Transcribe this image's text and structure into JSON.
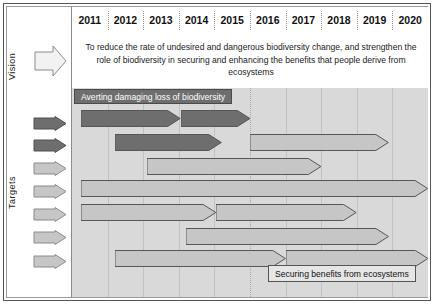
{
  "figure": {
    "sidebar": {
      "vision_label": "Vision",
      "targets_label": "Targets",
      "vision_arrow_icon": "right-arrow-outline-icon",
      "target_arrow_icons": [
        "right-arrow-dark-icon",
        "right-arrow-dark-icon",
        "right-arrow-light-icon",
        "right-arrow-light-icon",
        "right-arrow-light-icon",
        "right-arrow-light-icon",
        "right-arrow-light-icon"
      ]
    },
    "vision_statement": "To reduce the rate of undesired and dangerous biodiversity change,  and strengthen the role of biodiversity in securing and enhancing the benefits that people derive from ecosystems",
    "banners": {
      "top_left": "Averting damaging loss of biodiversity",
      "bottom_right": "Securing benefits from ecosystems"
    },
    "colors": {
      "plot_background": "#d9d9d9",
      "dark_bar": "#6e6e6e",
      "light_bar": "#c6c6c6",
      "bar_outline": "#555555",
      "grid": "#c2c2c2",
      "banner_dark_bg": "#6e6e6e",
      "banner_light_bg": "#e6e6e6"
    }
  },
  "chart_data": {
    "type": "bar",
    "xlabel": "",
    "ylabel": "Targets",
    "grid": true,
    "legend": "none",
    "x": [
      "2011",
      "2012",
      "2013",
      "2014",
      "2015",
      "2016",
      "2017",
      "2018",
      "2019",
      "2020"
    ],
    "xlim": [
      2011,
      2021
    ],
    "categories": [
      "Target row 1",
      "Target row 2",
      "Target row 3",
      "Target row 4",
      "Target row 5",
      "Target row 6",
      "Target row 7"
    ],
    "series": [
      {
        "name": "Target row 1",
        "row": 1,
        "bars": [
          {
            "start_year": 2011.25,
            "end_year": 2014.05,
            "shade": "dark"
          },
          {
            "start_year": 2014.05,
            "end_year": 2016.0,
            "shade": "dark"
          }
        ]
      },
      {
        "name": "Target row 2",
        "row": 2,
        "bars": [
          {
            "start_year": 2012.2,
            "end_year": 2015.2,
            "shade": "dark"
          },
          {
            "start_year": 2016.0,
            "end_year": 2019.9,
            "shade": "light"
          }
        ]
      },
      {
        "name": "Target row 3",
        "row": 3,
        "bars": [
          {
            "start_year": 2013.1,
            "end_year": 2018.0,
            "shade": "light"
          }
        ]
      },
      {
        "name": "Target row 4",
        "row": 4,
        "bars": [
          {
            "start_year": 2011.25,
            "end_year": 2021.0,
            "shade": "light"
          }
        ]
      },
      {
        "name": "Target row 5",
        "row": 5,
        "bars": [
          {
            "start_year": 2011.25,
            "end_year": 2015.05,
            "shade": "light"
          },
          {
            "start_year": 2015.05,
            "end_year": 2019.0,
            "shade": "light"
          }
        ]
      },
      {
        "name": "Target row 6",
        "row": 6,
        "bars": [
          {
            "start_year": 2014.2,
            "end_year": 2019.9,
            "shade": "light"
          }
        ]
      },
      {
        "name": "Target row 7",
        "row": 7,
        "bars": [
          {
            "start_year": 2012.2,
            "end_year": 2017.0,
            "shade": "light"
          },
          {
            "start_year": 2017.0,
            "end_year": 2021.0,
            "shade": "light"
          }
        ]
      }
    ],
    "annotations": [
      {
        "text": "Averting damaging loss of biodiversity",
        "position": "top-left"
      },
      {
        "text": "Securing benefits from ecosystems",
        "position": "bottom-right"
      }
    ]
  }
}
